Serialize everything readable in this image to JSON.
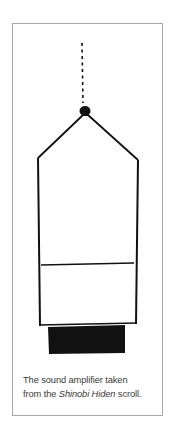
{
  "figure": {
    "caption": {
      "line1": "The sound amplifier taken",
      "line2_prefix": "from the ",
      "line2_italic": "Shinobi Hiden",
      "line2_suffix": " scroll."
    },
    "illustration": {
      "subject": "sound-amplifier-drawing",
      "ink_color": "#111111",
      "frame_color": "#a8a8a8"
    }
  }
}
